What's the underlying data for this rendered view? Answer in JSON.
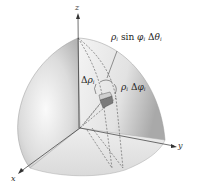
{
  "figure": {
    "axes": {
      "x_label": "x",
      "y_label": "y",
      "z_label": "z"
    },
    "labels": {
      "arc_theta": {
        "rho": "ρ",
        "sub_i": "i",
        "sin": " sin ",
        "phi": "φ",
        "sub_i2": "i",
        "delta": " Δ",
        "theta": "θ",
        "sub_i3": "i"
      },
      "delta_rho": {
        "delta": "Δ",
        "rho": "ρ",
        "sub_i": "i"
      },
      "arc_phi": {
        "rho": "ρ",
        "sub_i": "i",
        "delta": " Δ",
        "phi": "φ",
        "sub_i2": "i"
      }
    },
    "colors": {
      "sphere_light": "#f2f2f2",
      "sphere_mid": "#d6d6d6",
      "sphere_dark": "#a8a8a8",
      "axis": "#333333",
      "dash": "#555555",
      "wedge": "#7a7a7a"
    }
  }
}
